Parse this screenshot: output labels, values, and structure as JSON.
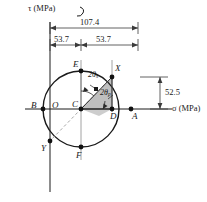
{
  "figure": {
    "type": "mohrs-circle",
    "axes": {
      "tau_label": "τ (MPa)",
      "sigma_label": "σ (MPa)"
    },
    "dimensions": {
      "total": "107.4",
      "left_half": "53.7",
      "right_half": "53.7",
      "vertical": "52.5"
    },
    "angles": {
      "theta_s_prefix": "2θ",
      "theta_s_sub": "s",
      "theta_p_prefix": "2θ",
      "theta_p_sub": "p"
    },
    "points": {
      "B": "B",
      "O": "O",
      "C": "C",
      "D": "D",
      "A": "A",
      "E": "E",
      "F": "F",
      "X": "X",
      "Y": "Y"
    },
    "colors": {
      "stroke": "#1a1a1a",
      "shade_fill": "#b9b9b9",
      "dim_line": "#3a3a3a",
      "dashed": "#8a8a8a",
      "background": "#ffffff"
    },
    "geometry": {
      "center_x": 81,
      "center_y": 109,
      "radius": 38,
      "tau_axis_x": 50,
      "sigma_axis_y": 109,
      "x_point_x": 112,
      "x_point_y": 77,
      "y_point_x": 50,
      "y_point_y": 141
    }
  }
}
